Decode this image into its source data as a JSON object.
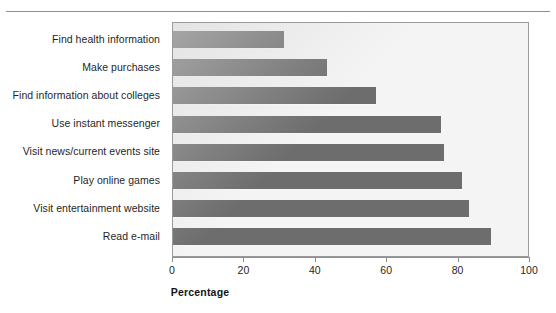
{
  "chart_data": {
    "type": "bar",
    "orientation": "horizontal",
    "title": "",
    "xlabel": "Percentage",
    "ylabel": "",
    "xlim": [
      0,
      100
    ],
    "xticks": [
      0,
      20,
      40,
      60,
      80,
      100
    ],
    "xtick_labels": [
      "0",
      "20",
      "40",
      "60",
      "80",
      "100"
    ],
    "grid": false,
    "legend": null,
    "categories": [
      "Find health information",
      "Make purchases",
      "Find information about colleges",
      "Use instant messenger",
      "Visit news/current events site",
      "Play online games",
      "Visit entertainment website",
      "Read e-mail"
    ],
    "values": [
      31,
      43,
      57,
      75,
      76,
      81,
      83,
      89
    ],
    "bar_color": "#6d6d6d",
    "plot_background": "#f4f4f4",
    "frame_color": "#9a9a9a"
  },
  "axis": {
    "x_title": "Percentage"
  }
}
